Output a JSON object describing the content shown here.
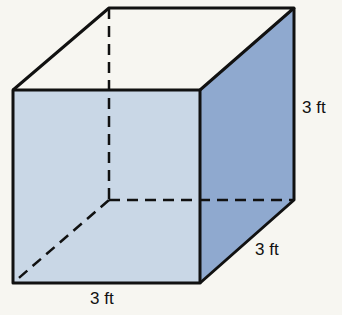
{
  "figure": {
    "type": "cube",
    "colors": {
      "background": "#f7f6f1",
      "front_face": "#c9d7e6",
      "side_face": "#8fa9cf",
      "top_face": "#f7f6f1",
      "edge": "#111111"
    },
    "labels": {
      "height": "3 ft",
      "depth": "3 ft",
      "width": "3 ft"
    }
  }
}
